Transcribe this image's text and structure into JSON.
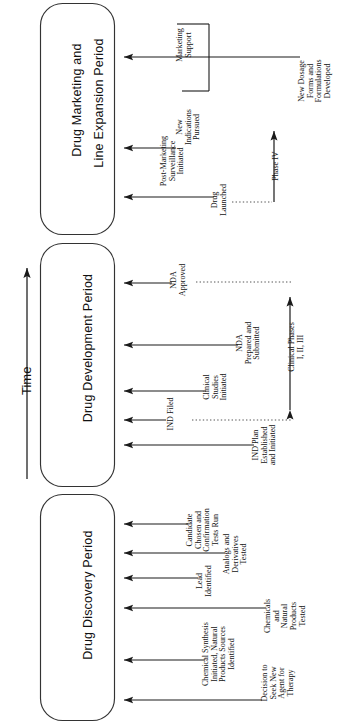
{
  "figure": {
    "type": "process-timeline-diagram",
    "orientation": "rotated-90-ccw",
    "axis_label": "Time",
    "axis_direction": "upward-arrow",
    "colors": {
      "ink": "#1a1a1a",
      "background": "#ffffff",
      "box_stroke": "#333333"
    }
  },
  "phases": [
    {
      "id": "discovery",
      "title": "Drug Discovery Period",
      "events": [
        "Candidate Chosen and Confirmation Tests Run",
        "Analogs and Derivatives Tested",
        "Lead Identified",
        "Chemicals and Natural Products Tested",
        "Chemical Synthesis Initiated, Natural Products Sources Identified",
        "Decision to Seek New Agent for Therapy"
      ]
    },
    {
      "id": "development",
      "title": "Drug Development Period",
      "events": [
        "NDA Approved",
        "NDA Prepared and Submitted",
        "Clinical Studies Initiated",
        "IND Filed",
        "IND Plan Established and Initiated"
      ],
      "span_annotation": "Clinical Phases I, II, III"
    },
    {
      "id": "marketing",
      "title": "Drug Marketing and Line Expansion Period",
      "title_lines": [
        "Drug Marketing and",
        "Line Expansion Period"
      ],
      "events": [
        "Marketing Support",
        "New Indications Pursued",
        "New Dosage Forms and Formulations Developed",
        "Post-Marketing Surveillance Initiated",
        "Drug Launched"
      ],
      "span_annotation": "Phase IV"
    }
  ],
  "annotations": {
    "a1_marketing_support": "Marketing\nSupport",
    "a2_new_indications": "New\nIndications\nPursued",
    "a3_new_dosage": "New Dosage\nForms and\nFormulations\nDeveloped",
    "a4_post_marketing": "Post-Marketing\nSurveillance\nInitiated",
    "a5_drug_launched": "Drug\nLaunched",
    "a6_phase_iv": "Phase IV",
    "a7_nda_approved": "NDA\nApproved",
    "a8_nda_prepared": "NDA\nPrepared and\nSubmitted",
    "a9_clinical_phases": "Clinical Phases\nI, II, III",
    "a10_clinical_studies": "Clinical\nStudies\nInitiated",
    "a11_ind_filed": "IND Filed",
    "a12_ind_plan": "IND Plan\nEstablished\nand Initiated",
    "a13_candidate": "Candidate\nChosen and\nConfirmation\nTests Run",
    "a14_analogs": "Analogs and\nDerivatives\nTested",
    "a15_lead": "Lead\nIdentified",
    "a16_chemicals": "Chemicals\nand\nNatural\nProducts\nTested",
    "a17_chem_synth": "Chemical Synthesis\nInitiated, Natural\nProducts Sources\nIdentified",
    "a18_decision": "Decision to\nSeek New\nAgent for\nTherapy"
  },
  "phase_titles": {
    "marketing_line1": "Drug Marketing and",
    "marketing_line2": "Line Expansion Period",
    "development": "Drug Development Period",
    "discovery": "Drug Discovery Period"
  },
  "time_axis": {
    "label": "Time"
  }
}
